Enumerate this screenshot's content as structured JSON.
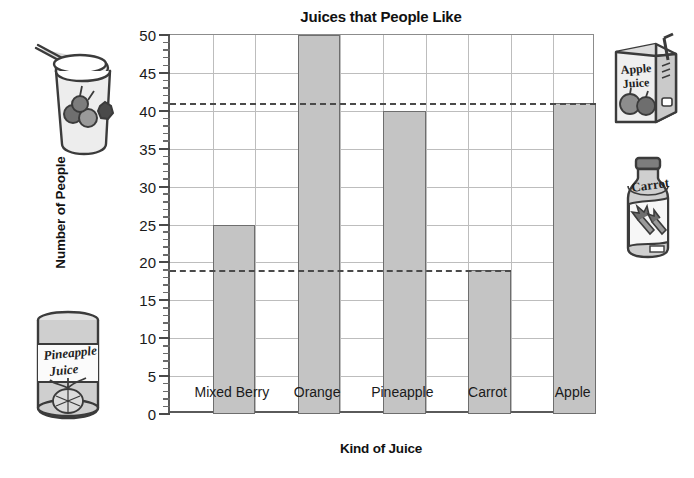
{
  "chart_data": {
    "type": "bar",
    "title": "Juices that People Like",
    "xlabel": "Kind of Juice",
    "ylabel": "Number of People",
    "categories": [
      "Mixed Berry",
      "Orange",
      "Pineapple",
      "Carrot",
      "Apple"
    ],
    "values": [
      25,
      50,
      40,
      19,
      41
    ],
    "ylim": [
      0,
      50
    ],
    "ytick_step": 5,
    "yticks": [
      0,
      5,
      10,
      15,
      20,
      25,
      30,
      35,
      40,
      45,
      50
    ],
    "ytick_labels": [
      "0",
      "5",
      "10",
      "15",
      "20",
      "25",
      "30",
      "35",
      "40",
      "45",
      "50"
    ],
    "minor_tick_step": 1,
    "grid": true,
    "legend": "none",
    "reference_lines": [
      {
        "value": 41,
        "style": "dashed",
        "note": "aligned with Apple bar top"
      },
      {
        "value": 19,
        "style": "dashed",
        "note": "aligned with Carrot bar top"
      }
    ],
    "bar_fill": "#c4c4c4",
    "bar_border": "#6e6e6e"
  },
  "illustrations": [
    {
      "id": "mixed-berry-smoothie-cup",
      "label": "",
      "position": "top-left"
    },
    {
      "id": "pineapple-juice-can",
      "label": "Pineapple Juice",
      "position": "bottom-left"
    },
    {
      "id": "apple-juice-carton",
      "label": "Apple Juice",
      "position": "top-right"
    },
    {
      "id": "carrot-juice-bottle",
      "label": "Carrot",
      "position": "middle-right"
    }
  ]
}
